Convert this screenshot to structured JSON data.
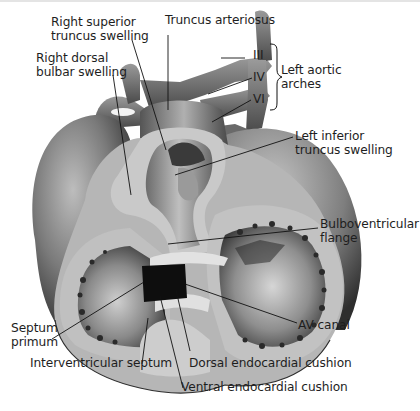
{
  "figure": {
    "labels": {
      "right_superior_truncus_swelling": [
        "Right superior",
        "truncus swelling"
      ],
      "truncus_arteriosus": "Truncus arteriosus",
      "right_dorsal_bulbar_swelling": [
        "Right dorsal",
        "bulbar swelling"
      ],
      "arch_iii": "III",
      "arch_iv": "IV",
      "arch_vi": "VI",
      "left_aortic_arches": [
        "Left aortic",
        "arches"
      ],
      "left_inferior_truncus_swelling": [
        "Left inferior",
        "truncus swelling"
      ],
      "bulboventricular_flange": [
        "Bulboventricular",
        "flange"
      ],
      "septum_primum": [
        "Septum",
        "primum"
      ],
      "av_canal": "AV canal",
      "interventricular_septum": "Interventricular septum",
      "dorsal_endocardial_cushion": "Dorsal endocardial cushion",
      "ventral_endocardial_cushion": "Ventral endocardial cushion"
    },
    "colors": {
      "background": "#ffffff",
      "text": "#1e1e1e",
      "leader_line": "#111111",
      "tissue_dark": "#3a3a3a",
      "tissue_mid": "#8a8a8a",
      "tissue_light": "#c8c8c8",
      "cut_surface": "#bdbdbd",
      "av_canal_fill": "#0e0e0e"
    }
  }
}
